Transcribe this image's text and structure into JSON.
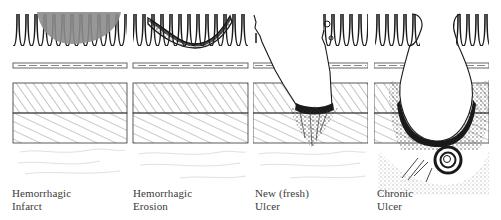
{
  "figure": {
    "type": "medical-illustration",
    "colors": {
      "ink": "#1a1a1a",
      "hatch": "#6a6a6a",
      "infarct_fill": "#8c8c8c",
      "serosa": "#d6d6d6",
      "label": "#3a3a3a"
    },
    "layers": [
      "mucosa",
      "muscularis-mucosae",
      "submucosa",
      "muscularis-propria",
      "serosa"
    ],
    "panels": [
      {
        "id": "hemorrhagic-infarct",
        "label_line1": "Hemorrhagic",
        "label_line2": "Infarct"
      },
      {
        "id": "hemorrhagic-erosion",
        "label_line1": "Hemorrhagic",
        "label_line2": "Erosion"
      },
      {
        "id": "new-fresh-ulcer",
        "label_line1": "New (fresh)",
        "label_line2": "Ulcer"
      },
      {
        "id": "chronic-ulcer",
        "label_line1": "Chronic",
        "label_line2": "Ulcer"
      }
    ]
  }
}
